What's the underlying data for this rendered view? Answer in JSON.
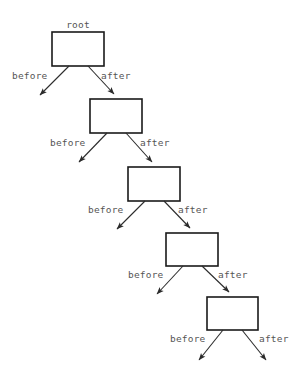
{
  "diagram": {
    "type": "tree",
    "background_color": "#ffffff",
    "box_stroke_color": "#1a1a1a",
    "edge_color": "#2b2b2b",
    "label_color": "#555555",
    "root_label": "root",
    "nodes": [
      {
        "id": "n1",
        "label": "",
        "x": 52,
        "y": 32,
        "w": 52,
        "h": 34
      },
      {
        "id": "n2",
        "label": "",
        "x": 90,
        "y": 99,
        "w": 52,
        "h": 34
      },
      {
        "id": "n3",
        "label": "",
        "x": 128,
        "y": 167,
        "w": 52,
        "h": 34
      },
      {
        "id": "n4",
        "label": "",
        "x": 166,
        "y": 233,
        "w": 52,
        "h": 33
      },
      {
        "id": "n5",
        "label": "",
        "x": 207,
        "y": 297,
        "w": 51,
        "h": 33
      }
    ],
    "edges": [
      {
        "from": "n1",
        "to": null,
        "label": "before",
        "direction": "down-left",
        "label_x": 12,
        "label_y": 79
      },
      {
        "from": "n1",
        "to": "n2",
        "label": "after",
        "direction": "down-right",
        "label_x": 101,
        "label_y": 79
      },
      {
        "from": "n2",
        "to": null,
        "label": "before",
        "direction": "down-left",
        "label_x": 50,
        "label_y": 146
      },
      {
        "from": "n2",
        "to": "n3",
        "label": "after",
        "direction": "down-right",
        "label_x": 140,
        "label_y": 146
      },
      {
        "from": "n3",
        "to": null,
        "label": "before",
        "direction": "down-left",
        "label_x": 88,
        "label_y": 213
      },
      {
        "from": "n3",
        "to": "n4",
        "label": "after",
        "direction": "down-right",
        "label_x": 178,
        "label_y": 213
      },
      {
        "from": "n4",
        "to": null,
        "label": "before",
        "direction": "down-left",
        "label_x": 128,
        "label_y": 278
      },
      {
        "from": "n4",
        "to": "n5",
        "label": "after",
        "direction": "down-right",
        "label_x": 218,
        "label_y": 278
      },
      {
        "from": "n5",
        "to": null,
        "label": "before",
        "direction": "down-left",
        "label_x": 170,
        "label_y": 342
      },
      {
        "from": "n5",
        "to": null,
        "label": "after",
        "direction": "down-right",
        "label_x": 259,
        "label_y": 342
      }
    ]
  }
}
